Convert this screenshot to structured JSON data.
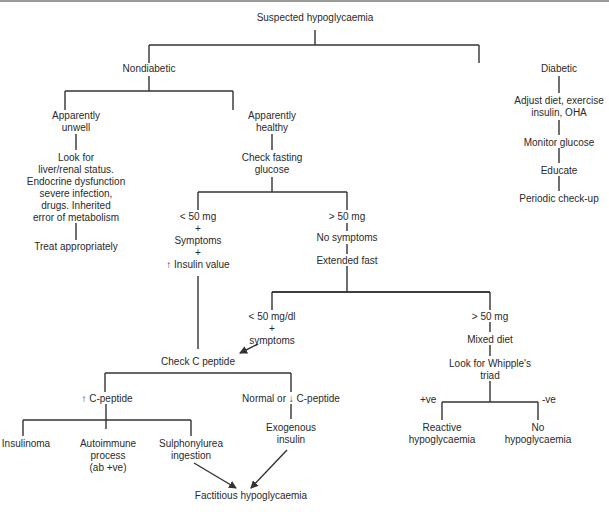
{
  "diagram": {
    "type": "flowchart",
    "title": "Suspected hypoglycaemia",
    "nodes": {
      "root": "Suspected hypoglycaemia",
      "nondiabetic": "Nondiabetic",
      "diabetic": "Diabetic",
      "unwell": "Apparently\nunwell",
      "healthy": "Apparently\nhealthy",
      "lookfor": "Look for\nliver/renal status.\nEndocrine dysfunction\nsevere infection,\ndrugs. Inherited\nerror of metabolism",
      "treat": "Treat appropriately",
      "checkfasting": "Check fasting\nglucose",
      "lt50": "< 50 mg\n+\nSymptoms\n+\n↑ Insulin value",
      "gt50": "> 50 mg",
      "nosymptoms": "No symptoms",
      "extfast": "Extended fast",
      "lt50dl": "< 50 mg/dl\n+\nsymptoms",
      "gt50b": "> 50 mg",
      "mixeddiet": "Mixed diet",
      "whipple": "Look for Whipple's\ntriad",
      "reactive": "Reactive\nhypoglycaemia",
      "nohypo": "No\nhypoglycaemia",
      "checkc": "Check C peptide",
      "upc": "↑ C-peptide",
      "normalc": "Normal or ↓ C-peptide",
      "insulinoma": "Insulinoma",
      "autoimmune": "Autoimmune\nprocess\n(ab +ve)",
      "sulpho": "Sulphonylurea\ningestion",
      "exogenous": "Exogenous\ninsulin",
      "factitious": "Factitious hypoglycaemia",
      "adjust": "Adjust diet, exercise\ninsulin, OHA",
      "monitor": "Monitor glucose",
      "educate": "Educate",
      "periodic": "Periodic check-up"
    },
    "edge_labels": {
      "pos": "+ve",
      "neg": "-ve"
    },
    "edges": [
      [
        "root",
        "nondiabetic"
      ],
      [
        "root",
        "diabetic"
      ],
      [
        "nondiabetic",
        "unwell"
      ],
      [
        "nondiabetic",
        "healthy"
      ],
      [
        "unwell",
        "lookfor"
      ],
      [
        "lookfor",
        "treat"
      ],
      [
        "healthy",
        "checkfasting"
      ],
      [
        "checkfasting",
        "lt50"
      ],
      [
        "checkfasting",
        "gt50"
      ],
      [
        "gt50",
        "nosymptoms"
      ],
      [
        "nosymptoms",
        "extfast"
      ],
      [
        "extfast",
        "lt50dl"
      ],
      [
        "extfast",
        "gt50b"
      ],
      [
        "gt50b",
        "mixeddiet"
      ],
      [
        "mixeddiet",
        "whipple"
      ],
      [
        "whipple",
        "reactive",
        "+ve"
      ],
      [
        "whipple",
        "nohypo",
        "-ve"
      ],
      [
        "lt50",
        "checkc"
      ],
      [
        "lt50dl",
        "checkc"
      ],
      [
        "checkc",
        "upc"
      ],
      [
        "checkc",
        "normalc"
      ],
      [
        "upc",
        "insulinoma"
      ],
      [
        "upc",
        "autoimmune"
      ],
      [
        "upc",
        "sulpho"
      ],
      [
        "normalc",
        "exogenous"
      ],
      [
        "sulpho",
        "factitious"
      ],
      [
        "exogenous",
        "factitious"
      ],
      [
        "diabetic",
        "adjust"
      ],
      [
        "adjust",
        "monitor"
      ],
      [
        "monitor",
        "educate"
      ],
      [
        "educate",
        "periodic"
      ]
    ],
    "colors": {
      "line": "#333333",
      "text": "#2a2a2a",
      "background": "#ffffff"
    }
  }
}
